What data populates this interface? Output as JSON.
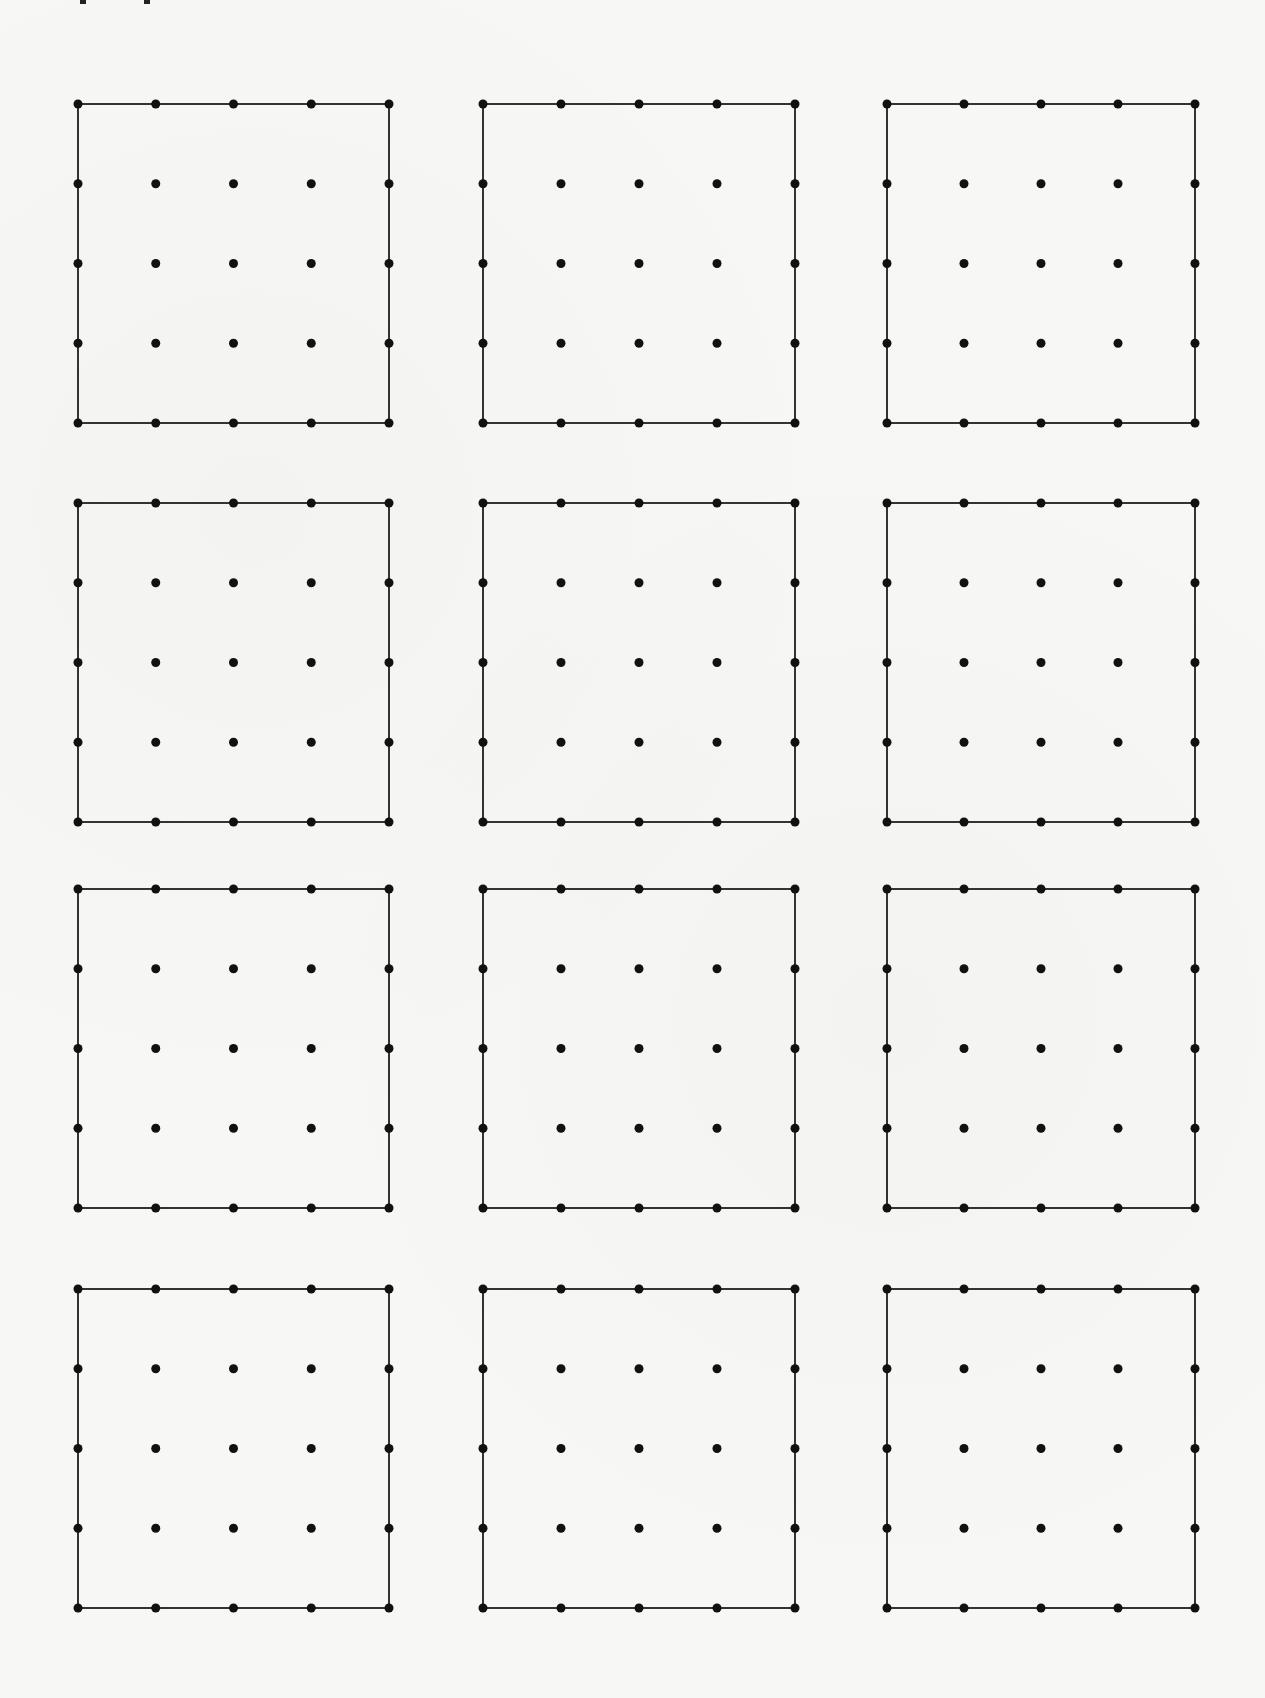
{
  "worksheet": {
    "type": "dot-grid geoboard worksheet",
    "header_fragments": [
      {
        "x": 80,
        "y": 0
      },
      {
        "x": 144,
        "y": 0
      }
    ],
    "colors": {
      "background": "#f7f7f5",
      "line": "#333333",
      "dot": "#111111"
    },
    "grid": {
      "rows": 4,
      "columns": 3,
      "dots_per_side": 5,
      "dot_radius": 4.5,
      "line_width": 2
    },
    "columns_x": [
      {
        "left": 78,
        "right": 389
      },
      {
        "left": 483,
        "right": 795
      },
      {
        "left": 887,
        "right": 1195
      }
    ],
    "rows_y": [
      {
        "top": 104,
        "bottom": 423
      },
      {
        "top": 503,
        "bottom": 822
      },
      {
        "top": 889,
        "bottom": 1208
      },
      {
        "top": 1289,
        "bottom": 1608
      }
    ]
  }
}
